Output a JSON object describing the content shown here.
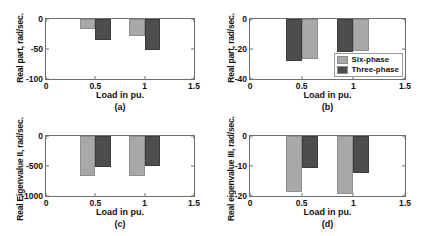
{
  "figure": {
    "background": "#ffffff",
    "colors": {
      "six_phase": "#a8a8a8",
      "three_phase": "#4d4d4d",
      "axis": "#6f6f6f"
    }
  },
  "legend": {
    "position": "bottom-right of panel (b)",
    "entries": [
      {
        "label": "Six-phase",
        "color": "#a8a8a8"
      },
      {
        "label": "Three-phase",
        "color": "#4d4d4d"
      }
    ]
  },
  "chart_data": [
    {
      "type": "bar",
      "panel": "(a)",
      "title": "",
      "xlabel": "Load in pu.",
      "ylabel": "Real part, rad/sec.",
      "xlim": [
        0,
        1.5
      ],
      "ylim": [
        -100,
        0
      ],
      "xticks": [
        "0",
        "0.5",
        "1",
        "1.5"
      ],
      "xtick_values": [
        0,
        0.5,
        1,
        1.5
      ],
      "yticks": [
        "0",
        "-50",
        "-100"
      ],
      "ytick_values": [
        0,
        -50,
        -100
      ],
      "grid": false,
      "categories": [
        0.5,
        1.0
      ],
      "series": [
        {
          "name": "Six-phase",
          "color": "#a8a8a8",
          "values": [
            -17,
            -28
          ]
        },
        {
          "name": "Three-phase",
          "color": "#4d4d4d",
          "values": [
            -35,
            -52
          ]
        }
      ],
      "bar_order": [
        "Six-phase",
        "Three-phase"
      ]
    },
    {
      "type": "bar",
      "panel": "(b)",
      "title": "",
      "xlabel": "Load in pu.",
      "ylabel": "Real part, rad/sec.",
      "xlim": [
        0,
        1.5
      ],
      "ylim": [
        -40,
        0
      ],
      "xticks": [
        "0",
        "0.5",
        "1",
        "1.5"
      ],
      "xtick_values": [
        0,
        0.5,
        1,
        1.5
      ],
      "yticks": [
        "0",
        "-20",
        "-40"
      ],
      "ytick_values": [
        0,
        -20,
        -40
      ],
      "grid": false,
      "categories": [
        0.5,
        1.0
      ],
      "series": [
        {
          "name": "Three-phase",
          "color": "#4d4d4d",
          "values": [
            -28,
            -22
          ]
        },
        {
          "name": "Six-phase",
          "color": "#a8a8a8",
          "values": [
            -26.5,
            -21
          ]
        }
      ],
      "bar_order": [
        "Three-phase",
        "Six-phase"
      ]
    },
    {
      "type": "bar",
      "panel": "(c)",
      "title": "",
      "xlabel": "Load in pu.",
      "ylabel": "Real Eigenvalue II, rad/sec.",
      "xlim": [
        0,
        1.5
      ],
      "ylim": [
        -1000,
        0
      ],
      "xticks": [
        "0",
        "0.5",
        "1",
        "1.5"
      ],
      "xtick_values": [
        0,
        0.5,
        1,
        1.5
      ],
      "yticks": [
        "0",
        "-500",
        "-1000"
      ],
      "ytick_values": [
        0,
        -500,
        -1000
      ],
      "grid": false,
      "categories": [
        0.5,
        1.0
      ],
      "series": [
        {
          "name": "Six-phase",
          "color": "#a8a8a8",
          "values": [
            -670,
            -660
          ]
        },
        {
          "name": "Three-phase",
          "color": "#4d4d4d",
          "values": [
            -520,
            -505
          ]
        }
      ],
      "bar_order": [
        "Six-phase",
        "Three-phase"
      ]
    },
    {
      "type": "bar",
      "panel": "(d)",
      "title": "",
      "xlabel": "Load in pu.",
      "ylabel": "Real eigenvalue III, rad/sec.",
      "xlim": [
        0,
        1.5
      ],
      "ylim": [
        -20,
        0
      ],
      "xticks": [
        "0",
        "0.5",
        "1",
        "1.5"
      ],
      "xtick_values": [
        0,
        0.5,
        1,
        1.5
      ],
      "yticks": [
        "0",
        "-10",
        "-20"
      ],
      "ytick_values": [
        0,
        -10,
        -20
      ],
      "grid": false,
      "categories": [
        0.5,
        1.0
      ],
      "series": [
        {
          "name": "Six-phase",
          "color": "#a8a8a8",
          "values": [
            -18.8,
            -19.2
          ]
        },
        {
          "name": "Three-phase",
          "color": "#4d4d4d",
          "values": [
            -10.5,
            -12.2
          ]
        }
      ],
      "bar_order": [
        "Six-phase",
        "Three-phase"
      ]
    }
  ]
}
